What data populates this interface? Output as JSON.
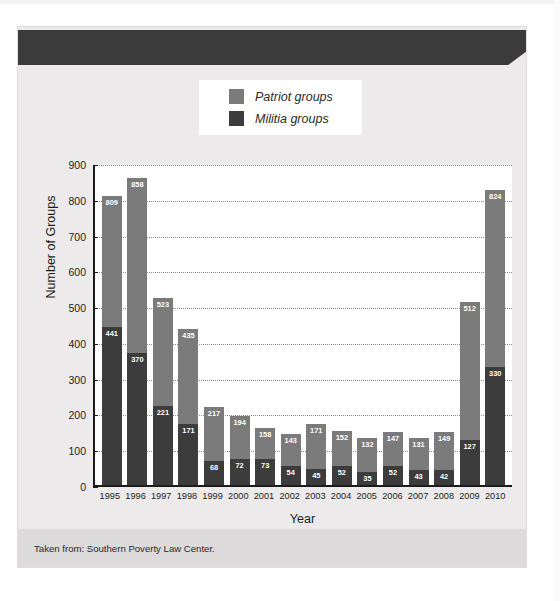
{
  "banner": {
    "title": "PATRIOT AND MILITIA GROUPS IN THE UNITED STATES, 1995–2010"
  },
  "legend": {
    "items": [
      {
        "label": "Patriot groups",
        "color": "#7b7b7b",
        "swatch_name": "legend-swatch-patriot"
      },
      {
        "label": "Militia groups",
        "color": "#3c3c3c",
        "swatch_name": "legend-swatch-militia"
      }
    ]
  },
  "source": {
    "text": "Taken from: Southern Poverty Law Center."
  },
  "chart_data": {
    "type": "bar",
    "title": "PATRIOT AND MILITIA GROUPS IN THE UNITED STATES, 1995–2010",
    "xlabel": "Year",
    "ylabel": "Number of Groups",
    "ylim": [
      0,
      900
    ],
    "yticks": [
      0,
      100,
      200,
      300,
      400,
      500,
      600,
      700,
      800,
      900
    ],
    "grid": true,
    "legend_position": "top-center",
    "overlap": "militia bars drawn in front of patriot bars",
    "categories": [
      "1995",
      "1996",
      "1997",
      "1998",
      "1999",
      "2000",
      "2001",
      "2002",
      "2003",
      "2004",
      "2005",
      "2006",
      "2007",
      "2008",
      "2009",
      "2010"
    ],
    "series": [
      {
        "name": "Patriot groups",
        "color": "#7b7b7b",
        "values": [
          809,
          858,
          523,
          435,
          217,
          194,
          158,
          143,
          171,
          152,
          132,
          147,
          131,
          149,
          512,
          824
        ]
      },
      {
        "name": "Militia groups",
        "color": "#3c3c3c",
        "values": [
          441,
          370,
          221,
          171,
          68,
          72,
          73,
          54,
          45,
          52,
          35,
          52,
          43,
          42,
          127,
          330
        ]
      }
    ]
  }
}
